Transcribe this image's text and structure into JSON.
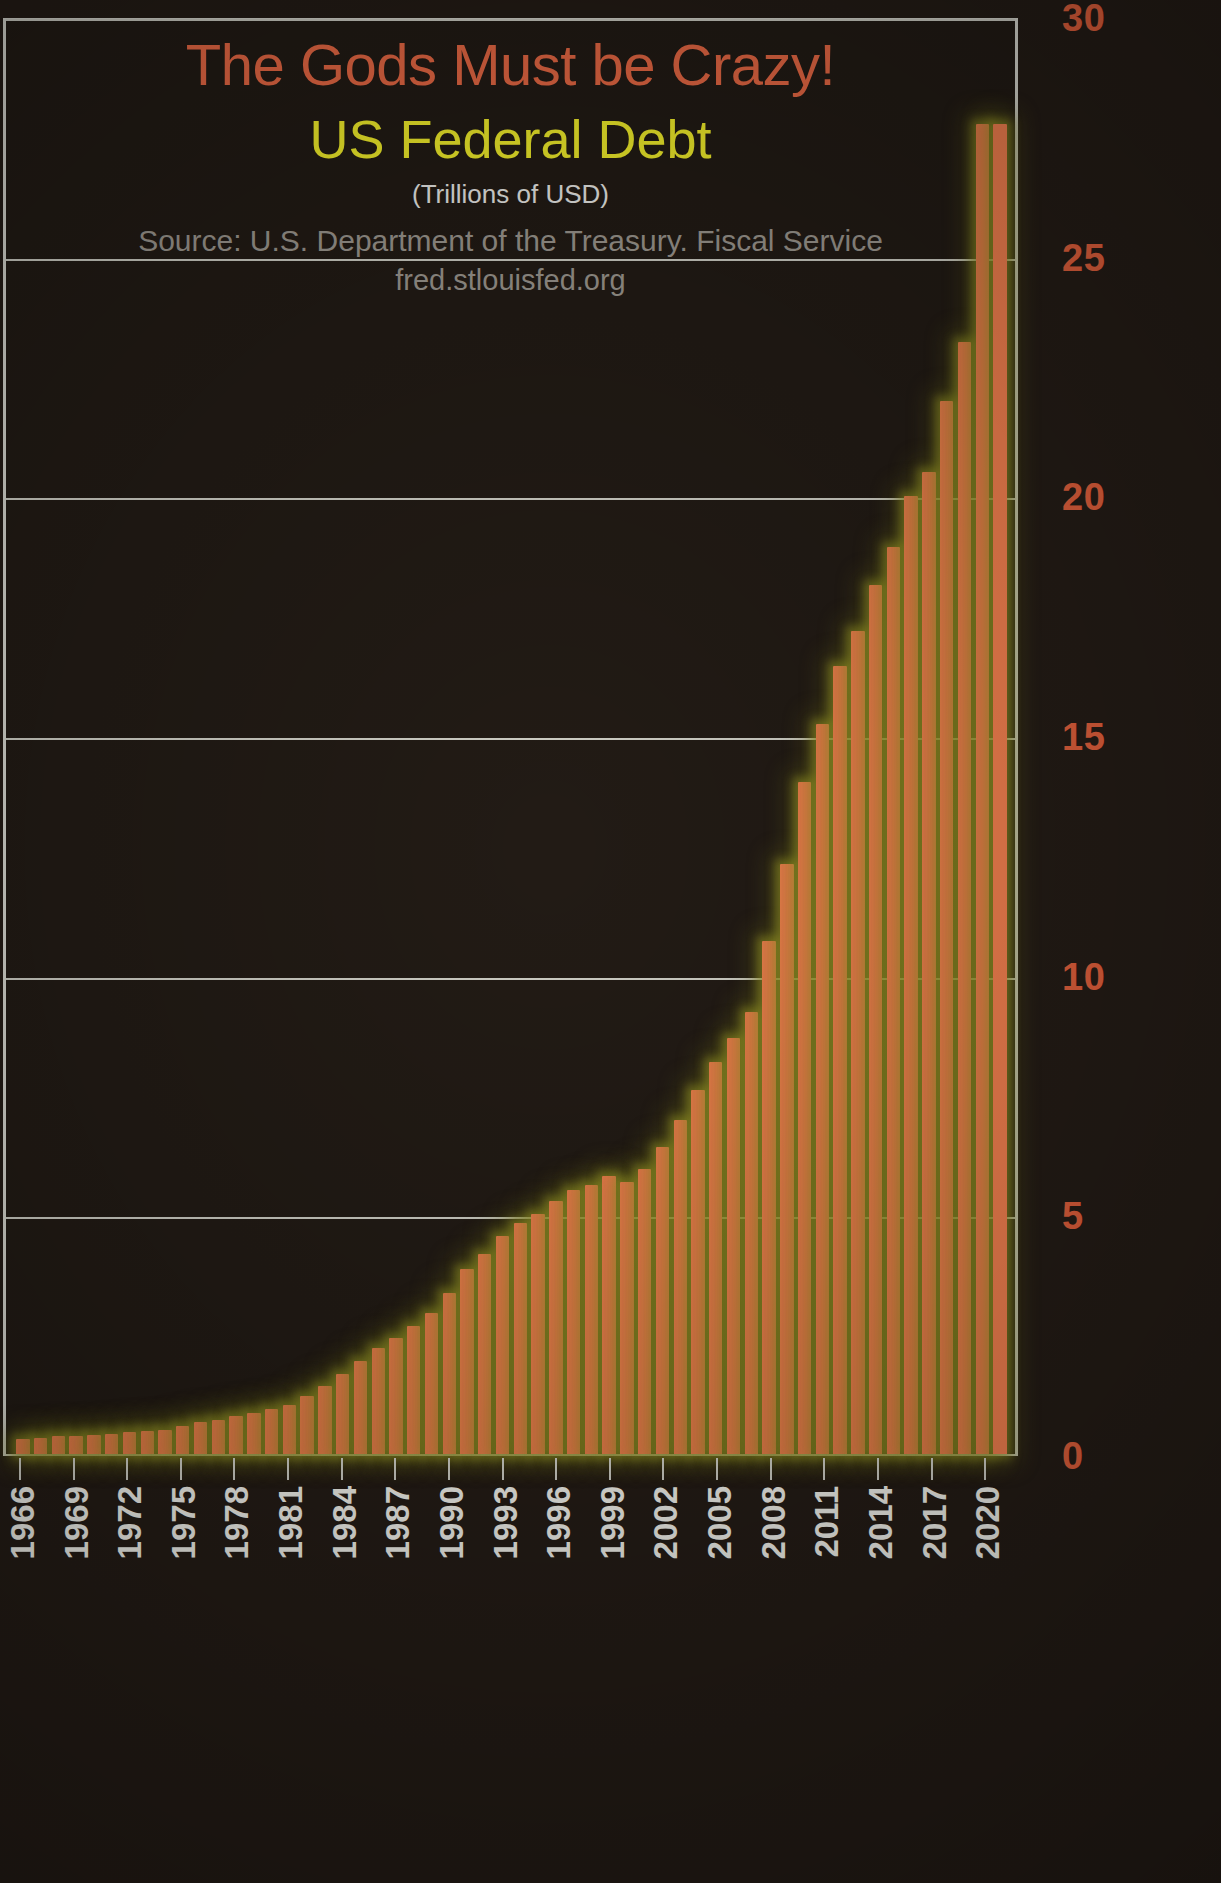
{
  "titles": {
    "main": "The Gods Must be Crazy!",
    "sub": "US Federal Debt",
    "units": "(Trillions of USD)",
    "source": "Source: U.S. Department of the Treasury. Fiscal Service",
    "url": "fred.stlouisfed.org"
  },
  "colors": {
    "background": "#241c16",
    "bar": "#f3804f",
    "bar_glow": "#9a9a28",
    "title_main": "#ec6a45",
    "title_sub": "#f5f12b",
    "units_text": "#ededea",
    "source_text": "#9d9890",
    "y_tick_text": "#e2603c",
    "x_tick_text": "#f2f2ec",
    "gridline": "#cfcfc6"
  },
  "chart_data": {
    "type": "bar",
    "title": "The Gods Must be Crazy! US Federal Debt",
    "subtitle": "(Trillions of USD)",
    "annotations": [
      "Source: U.S. Department of the Treasury. Fiscal Service",
      "fred.stlouisfed.org"
    ],
    "xlabel": "",
    "ylabel": "Trillions of USD",
    "ylim": [
      0,
      30
    ],
    "yticks": [
      0,
      5,
      10,
      15,
      20,
      25,
      30
    ],
    "ytick_labels": [
      "0",
      "5",
      "10",
      "15",
      "20",
      "25",
      "30"
    ],
    "grid": true,
    "legend": false,
    "xtick_labels": [
      "1966",
      "1969",
      "1972",
      "1975",
      "1978",
      "1981",
      "1984",
      "1987",
      "1990",
      "1993",
      "1996",
      "1999",
      "2002",
      "2005",
      "2008",
      "2011",
      "2014",
      "2017",
      "2020"
    ],
    "xtick_interval_years": 3,
    "categories": [
      "1966",
      "1967",
      "1968",
      "1969",
      "1970",
      "1971",
      "1972",
      "1973",
      "1974",
      "1975",
      "1976",
      "1977",
      "1978",
      "1979",
      "1980",
      "1981",
      "1982",
      "1983",
      "1984",
      "1985",
      "1986",
      "1987",
      "1988",
      "1989",
      "1990",
      "1991",
      "1992",
      "1993",
      "1994",
      "1995",
      "1996",
      "1997",
      "1998",
      "1999",
      "2000",
      "2001",
      "2002",
      "2003",
      "2004",
      "2005",
      "2006",
      "2007",
      "2008",
      "2009",
      "2010",
      "2011",
      "2012",
      "2013",
      "2014",
      "2015",
      "2016",
      "2017",
      "2018",
      "2019",
      "2020",
      "2021"
    ],
    "values": [
      0.32,
      0.34,
      0.37,
      0.37,
      0.39,
      0.42,
      0.45,
      0.47,
      0.5,
      0.58,
      0.67,
      0.72,
      0.79,
      0.85,
      0.93,
      1.03,
      1.2,
      1.41,
      1.66,
      1.95,
      2.22,
      2.43,
      2.68,
      2.95,
      3.36,
      3.87,
      4.17,
      4.54,
      4.81,
      5.0,
      5.28,
      5.5,
      5.61,
      5.79,
      5.67,
      5.94,
      6.41,
      6.96,
      7.6,
      8.17,
      8.68,
      9.23,
      10.7,
      12.31,
      14.03,
      15.22,
      16.43,
      17.16,
      18.14,
      18.92,
      19.98,
      20.49,
      21.97,
      23.2,
      27.75,
      27.75
    ],
    "value_unit": "trillion USD",
    "peak": {
      "category": "2020",
      "value": 27.75
    }
  },
  "gridlines": [
    {
      "value": "30"
    },
    {
      "value": "25"
    },
    {
      "value": "20"
    },
    {
      "value": "15"
    },
    {
      "value": "10"
    },
    {
      "value": "5"
    },
    {
      "value": "0"
    }
  ]
}
